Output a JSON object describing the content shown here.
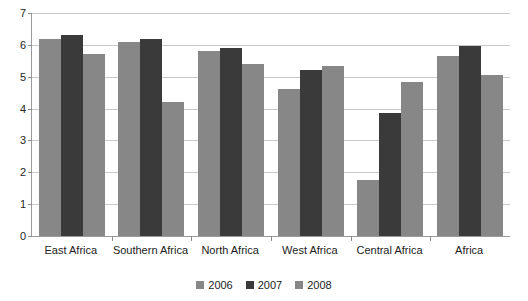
{
  "chart_data": {
    "type": "bar",
    "title": "",
    "xlabel": "",
    "ylabel": "",
    "ylim": [
      0,
      7
    ],
    "yticks": [
      0,
      1,
      2,
      3,
      4,
      5,
      6,
      7
    ],
    "grid": true,
    "legend_position": "bottom",
    "categories": [
      "East Africa",
      "Southern Africa",
      "North Africa",
      "West Africa",
      "Central Africa",
      "Africa"
    ],
    "series": [
      {
        "name": "2006",
        "color": "#878787",
        "values": [
          6.2,
          6.1,
          5.8,
          4.6,
          1.75,
          5.65
        ]
      },
      {
        "name": "2007",
        "color": "#3a3a3a",
        "values": [
          6.3,
          6.2,
          5.9,
          5.2,
          3.85,
          5.95
        ]
      },
      {
        "name": "2008",
        "color": "#878787",
        "values": [
          5.7,
          4.2,
          5.4,
          5.35,
          4.85,
          5.05
        ]
      }
    ]
  },
  "axis": {
    "tick_labels": [
      "0",
      "1",
      "2",
      "3",
      "4",
      "5",
      "6",
      "7"
    ]
  },
  "legend": {
    "items": [
      {
        "label": "2006"
      },
      {
        "label": "2007"
      },
      {
        "label": "2008"
      }
    ]
  }
}
